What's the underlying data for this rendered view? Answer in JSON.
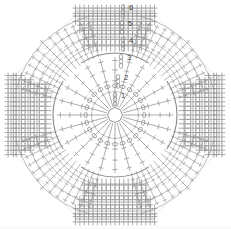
{
  "figure": {
    "kind": "stitch-diagram",
    "background_color": "#ffffff",
    "line_color": "#8a8a8a",
    "label_color": "#3a3a3a",
    "width_px": 231,
    "height_px": 229
  },
  "round_labels": [
    {
      "text": "1",
      "x": 121,
      "y": 98
    },
    {
      "text": "2",
      "x": 124,
      "y": 80
    },
    {
      "text": "3",
      "x": 127,
      "y": 60
    },
    {
      "text": "4",
      "x": 129,
      "y": 43
    },
    {
      "text": "5",
      "x": 128,
      "y": 26
    },
    {
      "text": "6",
      "x": 129,
      "y": 10
    }
  ],
  "chart_data": {
    "type": "table",
    "xlabel": "",
    "ylabel": "",
    "rounds": [
      {
        "number": "1",
        "label": "1",
        "radius": 12,
        "stitch": "chain-ring",
        "count": 8
      },
      {
        "number": "2",
        "label": "2",
        "radius": 26,
        "stitch": "treble",
        "count": 24
      },
      {
        "number": "3",
        "label": "3",
        "radius": 45,
        "stitch": "treble",
        "count": 32
      },
      {
        "number": "4",
        "label": "4",
        "radius": 62,
        "stitch": "treble-fan",
        "count": 40
      },
      {
        "number": "5",
        "label": "5",
        "radius": 80,
        "stitch": "treble",
        "count": 56
      },
      {
        "number": "6",
        "label": "6",
        "radius": 98,
        "stitch": "treble",
        "count": 64
      }
    ],
    "center": {
      "x": 115,
      "y": 115
    },
    "geometry": {
      "shape": "octagon",
      "inner_circle_radius": 62,
      "outer_extent": 104,
      "corner_fans": 4,
      "side_blocks": 4
    },
    "legend": [],
    "grid": false
  }
}
